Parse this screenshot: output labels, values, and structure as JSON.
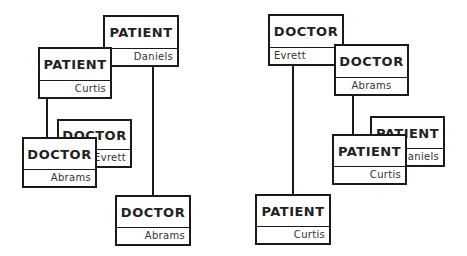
{
  "diagram": {
    "left_group": {
      "boxes": [
        {
          "id": "l-patient-daniels",
          "type": "PATIENT",
          "name": "Daniels"
        },
        {
          "id": "l-patient-curtis",
          "type": "PATIENT",
          "name": "Curtis"
        },
        {
          "id": "l-doctor-evrett",
          "type": "DOCTOR",
          "name": "Evrett"
        },
        {
          "id": "l-doctor-abrams-front",
          "type": "DOCTOR",
          "name": "Abrams"
        },
        {
          "id": "l-doctor-abrams-bottom",
          "type": "DOCTOR",
          "name": "Abrams"
        }
      ]
    },
    "right_group": {
      "boxes": [
        {
          "id": "r-doctor-evrett",
          "type": "DOCTOR",
          "name": "Evrett"
        },
        {
          "id": "r-doctor-abrams",
          "type": "DOCTOR",
          "name": "Abrams"
        },
        {
          "id": "r-patient-daniels",
          "type": "PATIENT",
          "name": "Daniels"
        },
        {
          "id": "r-patient-curtis-front",
          "type": "PATIENT",
          "name": "Curtis"
        },
        {
          "id": "r-patient-curtis-bottom",
          "type": "PATIENT",
          "name": "Curtis"
        }
      ]
    },
    "colors": {
      "stroke": "#1a1a1a",
      "fill": "#ffffff",
      "text": "#222222"
    }
  }
}
